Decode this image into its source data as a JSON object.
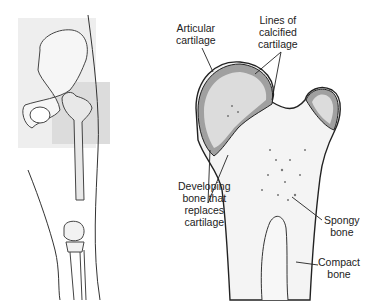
{
  "figure": {
    "left_panel": {
      "description": "Leg skeleton showing pelvis, femur, knee and tibia/fibula"
    },
    "right_panel": {
      "description": "Cross-section of proximal femur showing bone development"
    }
  },
  "labels": {
    "articular_cartilage": "Articular\ncartilage",
    "lines_calcified": "Lines of\ncalcified\ncartilage",
    "developing_bone": "Developing\nbone that\nreplaces\ncartilage",
    "spongy_bone": "Spongy\nbone",
    "compact_bone": "Compact\nbone"
  },
  "colors": {
    "outline": "#222222",
    "cartilage": "#8a8a8a",
    "bone_light": "#e6e6e6",
    "marrow": "#f4f4f4",
    "highlight_box": "#dedede",
    "skin_shade": "#ececec"
  }
}
